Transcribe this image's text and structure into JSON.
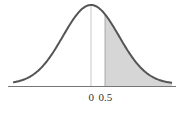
{
  "chart_data": {
    "type": "area",
    "title": "",
    "distribution": "standard normal",
    "mean": 0,
    "sd": 1,
    "shaded_region": {
      "from": 0.5,
      "to": "infinity",
      "color": "#d6d6d6"
    },
    "vertical_lines": [
      0,
      0.5
    ],
    "tick_labels": [
      "0",
      "0.5"
    ],
    "xlabel": "",
    "ylabel": "",
    "xlim": [
      -3.3,
      3.3
    ],
    "grid": false,
    "legend": null
  },
  "labels": {
    "zero": "0",
    "half": "0.5"
  },
  "colors": {
    "curve": "#555555",
    "shade": "#d6d6d6",
    "axis": "#777777",
    "mean_line": "#c8c8c8"
  }
}
